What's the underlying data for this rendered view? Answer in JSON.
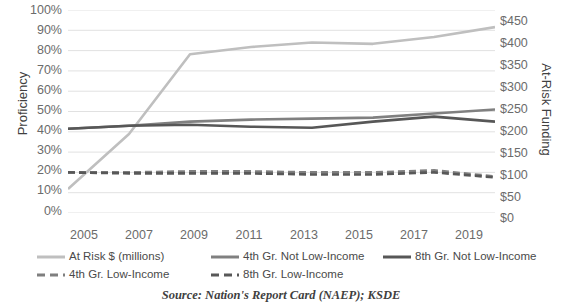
{
  "source_note": "Source: Nation's Report Card (NAEP); KSDE",
  "axes": {
    "left_title": "Proficiency",
    "right_title": "At-Risk Funding",
    "left_ticks": [
      "100%",
      "90%",
      "80%",
      "70%",
      "60%",
      "50%",
      "40%",
      "30%",
      "20%",
      "10%",
      "0%"
    ],
    "right_ticks": [
      "$450",
      "$400",
      "$350",
      "$300",
      "$250",
      "$200",
      "$150",
      "$100",
      "$50",
      "$0"
    ],
    "x_ticks": [
      "2005",
      "2007",
      "2009",
      "2011",
      "2013",
      "2015",
      "2017",
      "2019"
    ]
  },
  "legend": {
    "items": [
      {
        "label": "At Risk $ (millions)",
        "color": "#bfbfbf",
        "style": "solid"
      },
      {
        "label": "4th Gr. Not Low-Income",
        "color": "#808080",
        "style": "solid"
      },
      {
        "label": "8th Gr. Not Low-Income",
        "color": "#595959",
        "style": "solid"
      },
      {
        "label": "4th Gr. Low-Income",
        "color": "#7f7f7f",
        "style": "dashed"
      },
      {
        "label": "8th Gr. Low-Income",
        "color": "#595959",
        "style": "dashed"
      }
    ]
  },
  "colors": {
    "at_risk": "#bfbfbf",
    "grade4_not_low": "#808080",
    "grade8_not_low": "#575757",
    "grade4_low": "#7f7f7f",
    "grade8_low": "#585858",
    "gridline": "#d9d9d9",
    "text": "#595959"
  },
  "chart_data": {
    "type": "line",
    "title": "",
    "xlabel": "",
    "ylabel": "Proficiency",
    "y2label": "At-Risk Funding",
    "grid": true,
    "legend_position": "bottom",
    "x": [
      2005,
      2006,
      2007,
      2008,
      2009,
      2010,
      2011,
      2012,
      2013,
      2014,
      2015,
      2016,
      2017,
      2018,
      2019
    ],
    "ylim": [
      0,
      100
    ],
    "y2lim": [
      0,
      450
    ],
    "series": [
      {
        "name": "At Risk $ (millions)",
        "axis": "right",
        "style": "solid",
        "color": "#bfbfbf",
        "x": [
          2005,
          2007,
          2009,
          2011,
          2013,
          2015,
          2017,
          2019
        ],
        "values": [
          53,
          175,
          352,
          368,
          378,
          375,
          390,
          412
        ]
      },
      {
        "name": "4th Gr. Not Low-Income",
        "axis": "left",
        "style": "solid",
        "color": "#808080",
        "x": [
          2005,
          2007,
          2009,
          2011,
          2013,
          2015,
          2017,
          2019
        ],
        "values": [
          41.5,
          43,
          45,
          46,
          46.5,
          47,
          49,
          51
        ]
      },
      {
        "name": "8th Gr. Not Low-Income",
        "axis": "left",
        "style": "solid",
        "color": "#575757",
        "x": [
          2005,
          2007,
          2009,
          2011,
          2013,
          2015,
          2017,
          2019
        ],
        "values": [
          41.5,
          43,
          43.5,
          42.5,
          42,
          45,
          47.5,
          45
        ]
      },
      {
        "name": "4th Gr. Low-Income",
        "axis": "left",
        "style": "dashed",
        "color": "#7f7f7f",
        "x": [
          2005,
          2007,
          2009,
          2011,
          2013,
          2015,
          2017,
          2019
        ],
        "values": [
          20,
          20,
          20.5,
          20.5,
          20,
          20,
          21,
          18
        ]
      },
      {
        "name": "8th Gr. Low-Income",
        "axis": "left",
        "style": "dashed",
        "color": "#585858",
        "x": [
          2005,
          2007,
          2009,
          2011,
          2013,
          2015,
          2017,
          2019
        ],
        "values": [
          20,
          19.5,
          19.5,
          19.5,
          19,
          19,
          20,
          17.5
        ]
      }
    ]
  }
}
